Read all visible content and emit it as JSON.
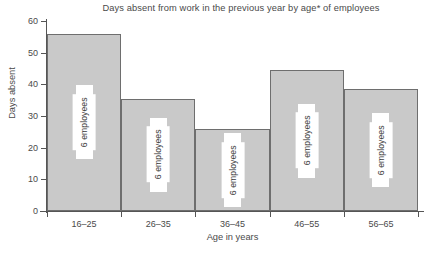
{
  "chart_data": {
    "type": "bar",
    "title": "Days absent from work in the previous year by age* of employees",
    "xlabel": "Age in years",
    "ylabel": "Days absent",
    "categories": [
      "16–25",
      "26–35",
      "36–45",
      "46–55",
      "56–65"
    ],
    "values": [
      56,
      35.5,
      26,
      44.5,
      38.5
    ],
    "bar_labels": [
      "6 employees",
      "6 employees",
      "6 employees",
      "6 employees",
      "6 employees"
    ],
    "ylim": [
      0,
      60
    ],
    "yticks": [
      0,
      10,
      20,
      30,
      40,
      50,
      60
    ],
    "ytick_labels": [
      "0",
      "10",
      "20",
      "30",
      "40",
      "50",
      "60"
    ],
    "grid": false,
    "legend": "none",
    "bar_gap": 0,
    "colors": {
      "bar_fill": "#c9c9c9",
      "bar_border": "#6e6e6e",
      "axis": "#555555",
      "text": "#4a4a4a",
      "label_box": "#ffffff",
      "background": "#ffffff"
    }
  },
  "footnote": ""
}
